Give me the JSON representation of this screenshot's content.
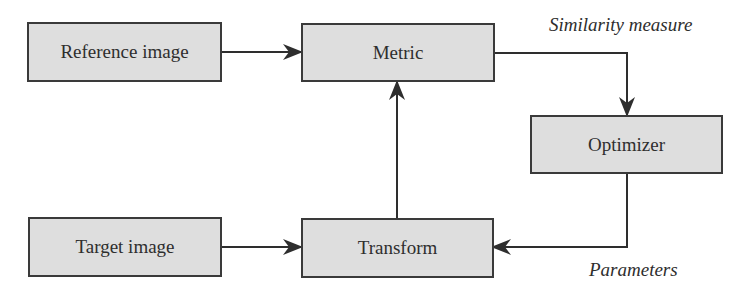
{
  "diagram": {
    "nodes": [
      {
        "id": "reference",
        "label": "Reference image"
      },
      {
        "id": "metric",
        "label": "Metric"
      },
      {
        "id": "optimizer",
        "label": "Optimizer"
      },
      {
        "id": "target",
        "label": "Target image"
      },
      {
        "id": "transform",
        "label": "Transform"
      }
    ],
    "edges": [
      {
        "from": "reference",
        "to": "metric"
      },
      {
        "from": "target",
        "to": "transform"
      },
      {
        "from": "transform",
        "to": "metric"
      },
      {
        "from": "metric",
        "to": "optimizer",
        "label": "Similarity measure"
      },
      {
        "from": "optimizer",
        "to": "transform",
        "label": "Parameters"
      }
    ],
    "labels": {
      "similarity": "Similarity measure",
      "parameters": "Parameters"
    },
    "colors": {
      "box_fill": "#dedede",
      "box_border": "#3a3a3a",
      "arrow": "#2e2e2e"
    }
  }
}
